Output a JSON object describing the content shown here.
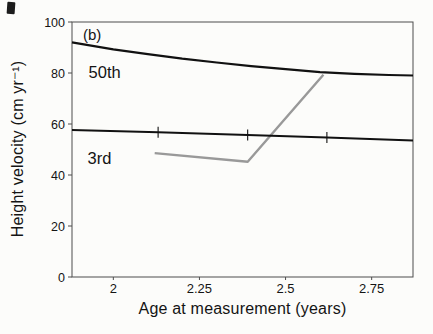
{
  "figure": {
    "panel_label": "(b)"
  },
  "chart_data": {
    "type": "line",
    "title": "",
    "xlabel": "Age at measurement (years)",
    "ylabel": "Height velocity (cm yr⁻¹)",
    "xlim": [
      1.88,
      2.87
    ],
    "ylim": [
      0,
      100
    ],
    "x_ticks": [
      2,
      2.25,
      2.5,
      2.75
    ],
    "x_tick_labels": [
      "2",
      "2.25",
      "2.5",
      "2.75"
    ],
    "y_ticks": [
      0,
      20,
      40,
      60,
      80,
      100
    ],
    "y_tick_labels": [
      "0",
      "20",
      "40",
      "60",
      "80",
      "100"
    ],
    "grid": false,
    "legend_position": "none (labels drawn inline on plot)",
    "colors": {
      "centile_line": "#111111",
      "patient_line": "#999999",
      "frame": "#4d4d4d",
      "text": "#141414"
    },
    "series": [
      {
        "name": "patient-measured-velocity",
        "label": "",
        "color": "#999999",
        "width": 2.4,
        "x": [
          2.12,
          2.39,
          2.61
        ],
        "y": [
          48.6,
          45.2,
          79.3
        ]
      },
      {
        "name": "centile-50th",
        "label": "50th",
        "color": "#111111",
        "width": 2.2,
        "x": [
          1.88,
          2.0,
          2.1,
          2.2,
          2.3,
          2.4,
          2.5,
          2.6,
          2.7,
          2.8,
          2.87
        ],
        "y": [
          92,
          89.3,
          87.4,
          85.6,
          84.1,
          82.7,
          81.5,
          80.3,
          79.7,
          79.2,
          79
        ]
      },
      {
        "name": "centile-3rd",
        "label": "3rd",
        "color": "#111111",
        "width": 2.0,
        "x": [
          1.88,
          2.13,
          2.39,
          2.62,
          2.87
        ],
        "y": [
          57.6,
          56.8,
          55.7,
          54.7,
          53.5
        ]
      }
    ],
    "measurement_ticks": {
      "on_series": "centile-3rd",
      "ages": [
        2.13,
        2.39,
        2.62
      ],
      "values": [
        56.8,
        55.7,
        54.7
      ]
    },
    "annotations": [
      {
        "text": "(b)",
        "x": 1.912,
        "y": 93.0,
        "size": 15
      },
      {
        "text": "50th",
        "x": 1.928,
        "y": 78.0,
        "size": 16.5
      },
      {
        "text": "3rd",
        "x": 1.925,
        "y": 44.3,
        "size": 16.5
      }
    ]
  }
}
